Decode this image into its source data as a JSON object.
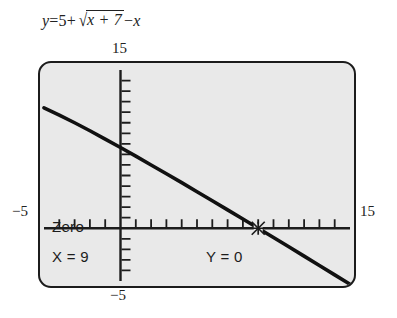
{
  "equation": {
    "lhs": "y",
    "equals": "=",
    "term_constant": "5",
    "plus": "+",
    "radicand": "x + 7",
    "minus": "−",
    "term_x": "x",
    "full_text": "y = 5 + √(x + 7) − x"
  },
  "axis_labels": {
    "top": "15",
    "bottom": "−5",
    "left": "−5",
    "right": "15"
  },
  "readout": {
    "title": "Zero",
    "x_value": "X = 9",
    "y_value": "Y = 0"
  },
  "colors": {
    "screen_background": "#e9e9e9",
    "screen_border": "#1c1c1c",
    "curve": "#111111",
    "axis": "#1c1c1c",
    "page_background": "#ffffff",
    "text": "#222222"
  },
  "chart_data": {
    "type": "line",
    "xlabel": "",
    "ylabel": "",
    "xlim": [
      -5,
      15
    ],
    "ylim": [
      -5,
      15
    ],
    "xtick_step": 1,
    "ytick_step": 1,
    "grid": false,
    "legend": "none",
    "annotations": [
      {
        "label": "Zero",
        "x": 9,
        "y": 0,
        "marker": "crosshair-cursor"
      }
    ],
    "series": [
      {
        "name": "y = 5 + sqrt(x + 7) - x",
        "x": [
          -5,
          -4,
          -3,
          -2,
          -1,
          0,
          1,
          2,
          3,
          4,
          5,
          6,
          7,
          8,
          9,
          10,
          11,
          12,
          13,
          14,
          15
        ],
        "y": [
          11.41,
          10.73,
          10.0,
          9.24,
          8.45,
          7.65,
          6.83,
          6.0,
          5.16,
          4.32,
          3.46,
          2.61,
          1.74,
          0.87,
          0.0,
          -0.88,
          -1.76,
          -2.64,
          -3.53,
          -4.42,
          -5.31
        ]
      }
    ]
  }
}
